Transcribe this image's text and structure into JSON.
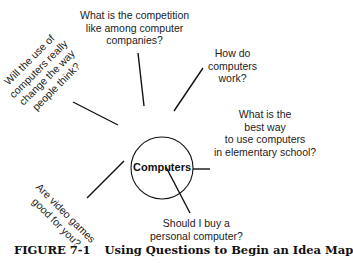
{
  "diagram": {
    "type": "idea-map",
    "center": {
      "label": "Computers"
    },
    "questions": [
      {
        "id": "competition",
        "lines": [
          "What is the competition",
          "like among computer",
          "companies?"
        ]
      },
      {
        "id": "how-work",
        "lines": [
          "How do",
          "computers",
          "work?"
        ]
      },
      {
        "id": "best-way",
        "lines": [
          "What is the",
          "best way",
          "to use computers",
          "in elementary school?"
        ]
      },
      {
        "id": "buy",
        "lines": [
          "Should I buy a",
          "personal computer?"
        ]
      },
      {
        "id": "video-games",
        "lines": [
          "Are video games",
          "good for you?"
        ]
      },
      {
        "id": "change-thinking",
        "lines": [
          "Will the use of",
          "computers really",
          "change the way",
          "people think?"
        ]
      }
    ],
    "colors": {
      "line": "#111111",
      "text": "#222222",
      "background": "#ffffff"
    }
  },
  "caption": {
    "number": "FIGURE 7-1",
    "title": "Using Questions to Begin an Idea Map"
  }
}
